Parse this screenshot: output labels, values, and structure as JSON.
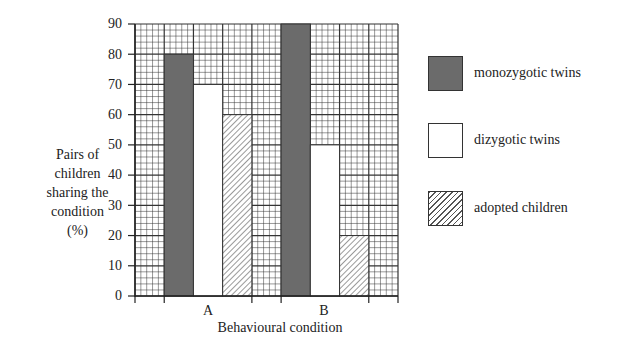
{
  "chart_data": {
    "type": "bar",
    "title": "",
    "xlabel": "Behavioural condition",
    "ylabel": "Pairs of children sharing the condition (%)",
    "ylabel_lines": [
      "Pairs of",
      "children",
      "sharing the",
      "condition",
      "(%)"
    ],
    "categories": [
      "A",
      "B"
    ],
    "series": [
      {
        "name": "monozygotic twins",
        "values": [
          80,
          90
        ],
        "fill": "#6b6b6b",
        "pattern": "solid"
      },
      {
        "name": "dizygotic twins",
        "values": [
          70,
          50
        ],
        "fill": "#ffffff",
        "pattern": "solid"
      },
      {
        "name": "adopted children",
        "values": [
          60,
          20
        ],
        "fill": "#ffffff",
        "pattern": "hatched"
      }
    ],
    "ylim": [
      0,
      90
    ],
    "yticks": [
      0,
      10,
      20,
      30,
      40,
      50,
      60,
      70,
      80,
      90
    ],
    "grid": true,
    "legend_position": "right"
  },
  "legend": [
    {
      "label": "monozygotic twins"
    },
    {
      "label": "dizygotic twins"
    },
    {
      "label": "adopted children"
    }
  ]
}
